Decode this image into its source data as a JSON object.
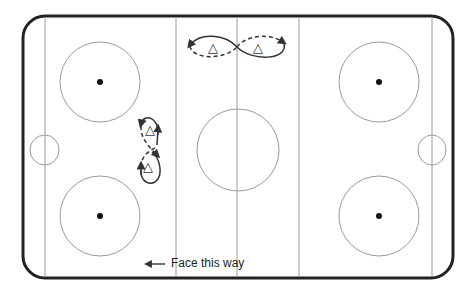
{
  "diagram": {
    "caption": "Face this way",
    "caption_arrow": "left-arrow",
    "colors": {
      "boards": "#222222",
      "lines": "#9a9a9a",
      "paths": "#333333",
      "dot": "#111111"
    },
    "rink": {
      "x": 23,
      "y": 16,
      "width": 430,
      "height": 262,
      "corner_radius": 22
    },
    "lines_x": [
      45,
      176,
      237,
      299,
      432
    ],
    "faceoff_circles": [
      {
        "cx": 100,
        "cy": 82,
        "r": 40
      },
      {
        "cx": 100,
        "cy": 216,
        "r": 40
      },
      {
        "cx": 379,
        "cy": 82,
        "r": 40
      },
      {
        "cx": 379,
        "cy": 216,
        "r": 40
      }
    ],
    "center_circle": {
      "cx": 238,
      "cy": 150,
      "r": 41
    },
    "players": [
      {
        "label": "△",
        "x": 213,
        "y": 48
      },
      {
        "label": "△",
        "x": 258,
        "y": 48
      },
      {
        "label": "△",
        "x": 150,
        "y": 130
      },
      {
        "label": "△",
        "x": 148,
        "y": 167
      }
    ]
  }
}
